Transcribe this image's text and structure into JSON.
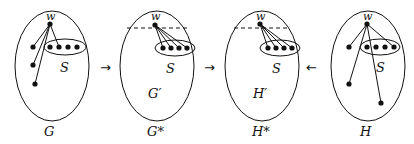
{
  "diagram": {
    "panels": [
      {
        "id": "G",
        "label": "G",
        "vertex": "w",
        "set": "S",
        "inner_label": "",
        "dashed": false
      },
      {
        "id": "Gstar",
        "label": "G*",
        "vertex": "w",
        "set": "S",
        "inner_label": "G′",
        "dashed": true
      },
      {
        "id": "Hstar",
        "label": "H*",
        "vertex": "w",
        "set": "S",
        "inner_label": "H′",
        "dashed": true
      },
      {
        "id": "H",
        "label": "H",
        "vertex": "w",
        "set": "S",
        "inner_label": "",
        "dashed": false
      }
    ],
    "arrows": [
      "→",
      "→",
      "←"
    ]
  }
}
